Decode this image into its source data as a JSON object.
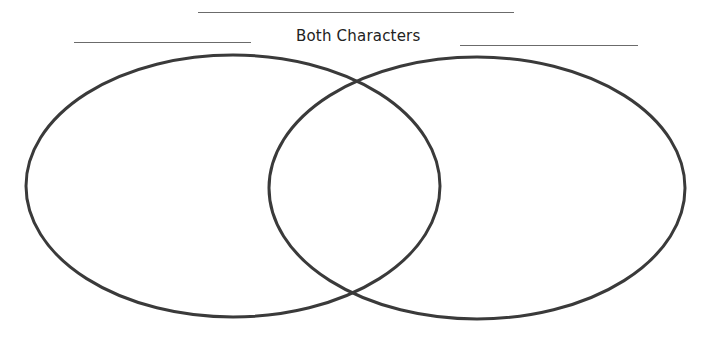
{
  "diagram": {
    "type": "venn",
    "title_blank": "",
    "left_label_blank": "",
    "right_label_blank": "",
    "intersection_label": "Both Characters",
    "stroke_color": "#3a3a3a",
    "line_color": "#6b6b6b",
    "circles": [
      {
        "name": "left-character",
        "cx": 233,
        "cy": 186,
        "rx": 207,
        "ry": 131
      },
      {
        "name": "right-character",
        "cx": 477,
        "cy": 188,
        "rx": 208,
        "ry": 131
      }
    ]
  }
}
